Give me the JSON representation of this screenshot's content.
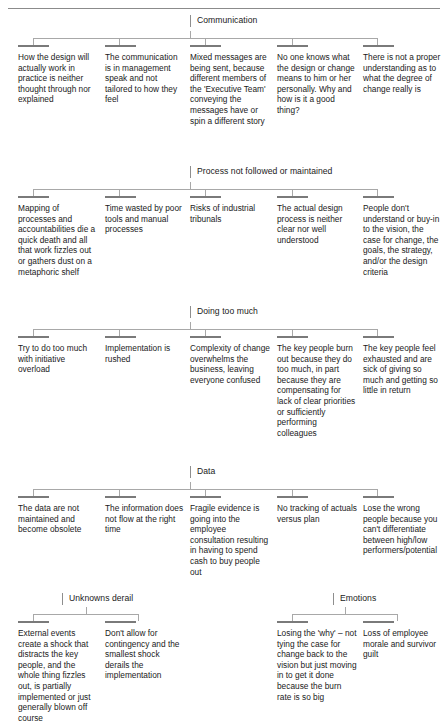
{
  "document": {
    "title": "Change Failure Themes Mind Map",
    "top_rule": true
  },
  "sections": [
    {
      "id": "communication",
      "label": "Communication",
      "cards": [
        {
          "text": "How the design will actually work in practice is neither thought through nor explained"
        },
        {
          "text": "The communication is in management speak and not tailored to how they feel"
        },
        {
          "text": "Mixed messages are being sent, because different members of the 'Executive Team' conveying the messages have or spin a different story"
        },
        {
          "text": "No one knows what the design or change means to him or her personally. Why and how is it a good thing?"
        },
        {
          "text": "There is not a proper understanding as to what the degree of change really is"
        }
      ]
    },
    {
      "id": "process-not-followed",
      "label": "Process not followed or maintained",
      "cards": [
        {
          "text": "Mapping of processes and accountabilities die a quick death and all that work fizzles out or gathers dust on a metaphoric shelf"
        },
        {
          "text": "Time wasted by poor tools and manual processes"
        },
        {
          "text": "Risks of industrial tribunals"
        },
        {
          "text": "The actual design process is neither clear nor well understood"
        },
        {
          "text": "People don't understand or buy-in to the vision, the case for change, the goals, the strategy, and/or the design criteria"
        }
      ]
    },
    {
      "id": "doing-too-much",
      "label": "Doing too much",
      "cards": [
        {
          "text": "Try to do too much with initiative overload"
        },
        {
          "text": "Implementation is rushed"
        },
        {
          "text": "Complexity of change overwhelms the business, leaving everyone confused"
        },
        {
          "text": "The key people burn out because they do too much, in part because they are compensating for lack of clear priorities or sufficiently performing colleagues"
        },
        {
          "text": "The key people feel exhausted and are sick of giving so much and getting so little in return"
        }
      ]
    },
    {
      "id": "data",
      "label": "Data",
      "cards": [
        {
          "text": "The data are not maintained and become obsolete"
        },
        {
          "text": "The information does not flow at the right time"
        },
        {
          "text": "Fragile evidence is going into the employee consultation resulting in having to spend cash to buy people out"
        },
        {
          "text": "No tracking of actuals versus plan"
        },
        {
          "text": "Lose the wrong people because you can't differentiate between high/low performers/potential"
        }
      ]
    },
    {
      "id": "unknowns-derail",
      "label": "Unknowns derail",
      "cards": [
        {
          "text": "External events create a shock that distracts the key people, and the whole thing fizzles out, is partially implemented or just generally blown off course"
        },
        {
          "text": "Don't allow for contingency and the smallest shock derails the implementation"
        }
      ]
    },
    {
      "id": "emotions",
      "label": "Emotions",
      "cards": [
        {
          "text": "Losing the 'why' – not tying the case for change back to the vision but just moving in to get it done because the burn rate is so big"
        },
        {
          "text": "Loss of employee morale and survivor guilt"
        }
      ]
    }
  ],
  "colors": {
    "text": "#1a1a1a",
    "rule": "#8b8b8b",
    "connector": "#a8a8a8",
    "card_bar": "#7a7a7a",
    "background": "#ffffff"
  }
}
